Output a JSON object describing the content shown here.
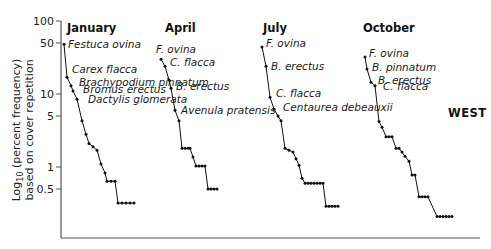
{
  "chart_data": {
    "type": "line",
    "title": "",
    "region_label": "WEST",
    "ylabel_line1": "Log10 (percent frequency)",
    "ylabel_line2": "based on cover repetition",
    "xlabel": "",
    "yscale": "log",
    "ylim": [
      0.15,
      100
    ],
    "yticks": [
      100,
      50,
      10,
      5,
      1,
      0.5
    ],
    "ytick_labels": [
      "100",
      "50",
      "10",
      "5",
      "1",
      "0.5"
    ],
    "grid": false,
    "legend": "none (direct species labels)",
    "series": [
      {
        "name": "January",
        "x_start_px": 64,
        "values": [
          48,
          17,
          13,
          11,
          8.5,
          4.3,
          2.8,
          2.1,
          1.9,
          1.7,
          1.1,
          0.83,
          0.64,
          0.64,
          0.64,
          0.32,
          0.32,
          0.32,
          0.32,
          0.32
        ],
        "xpx": [
          64,
          67,
          71,
          73,
          77,
          82,
          86,
          89,
          93,
          97,
          101,
          105,
          107,
          111,
          115,
          118,
          122,
          126,
          130,
          134
        ],
        "labels": [
          {
            "text": "Festuca ovina",
            "point": 0
          },
          {
            "text": "Carex flacca",
            "point": 1
          },
          {
            "text": "Brachypodium pinnatum",
            "point": 2
          },
          {
            "text": "Bromus erectus",
            "point": 3
          },
          {
            "text": "Dactylis glomerata",
            "point": 4
          }
        ]
      },
      {
        "name": "April",
        "values": [
          30,
          24,
          15.5,
          12,
          6,
          4.3,
          1.8,
          1.8,
          1.8,
          1.8,
          1.37,
          1.03,
          1.03,
          1.03,
          1.03,
          0.5,
          0.5,
          0.5,
          0.5
        ],
        "xpx": [
          161,
          165,
          169,
          171,
          175,
          179,
          182,
          185,
          188,
          190,
          193,
          196,
          199,
          202,
          205,
          208,
          211,
          214,
          217
        ],
        "labels": [
          {
            "text": "F. ovina",
            "point": 0
          },
          {
            "text": "C. flacca",
            "point": 1
          },
          {
            "text": "B. erectus",
            "point": 3
          },
          {
            "text": "Avenula pratensis",
            "point": 4
          }
        ]
      },
      {
        "name": "July",
        "values": [
          44,
          24,
          9,
          6.2,
          5,
          4.3,
          1.8,
          1.7,
          1.6,
          1.3,
          1.06,
          0.7,
          0.6,
          0.6,
          0.6,
          0.6,
          0.6,
          0.6,
          0.6,
          0.29,
          0.29,
          0.29,
          0.29,
          0.29
        ],
        "xpx": [
          262,
          266,
          270,
          274,
          278,
          281,
          285,
          289,
          293,
          296,
          299,
          302,
          305,
          308,
          311,
          314,
          317,
          320,
          323,
          326,
          329,
          332,
          335,
          338
        ],
        "labels": [
          {
            "text": "F. ovina",
            "point": 0
          },
          {
            "text": "B. erectus",
            "point": 1
          },
          {
            "text": "C. flacca",
            "point": 2
          },
          {
            "text": "Centaurea debeauxii",
            "point": 3
          }
        ]
      },
      {
        "name": "October",
        "values": [
          32,
          22,
          14.5,
          13,
          4.2,
          3.5,
          2.6,
          2.6,
          2.6,
          1.8,
          1.8,
          1.6,
          1.4,
          1.2,
          0.78,
          0.78,
          0.39,
          0.39,
          0.39,
          0.39,
          0.21,
          0.21,
          0.21,
          0.21,
          0.21,
          0.21
        ],
        "xpx": [
          365,
          367,
          371,
          375,
          379,
          382,
          386,
          389,
          392,
          396,
          399,
          402,
          405,
          409,
          412,
          415,
          419,
          422,
          425,
          428,
          437,
          440,
          443,
          446,
          449,
          452
        ],
        "labels": [
          {
            "text": "F. ovina",
            "point": 0
          },
          {
            "text": "B. pinnatum",
            "point": 1
          },
          {
            "text": "B. erectus",
            "point": 2
          },
          {
            "text": "C. flacca",
            "point": 3
          }
        ]
      }
    ]
  },
  "panels": [
    {
      "title": "January",
      "title_x": 67
    },
    {
      "title": "April",
      "title_x": 165
    },
    {
      "title": "July",
      "title_x": 263
    },
    {
      "title": "October",
      "title_x": 363
    }
  ]
}
